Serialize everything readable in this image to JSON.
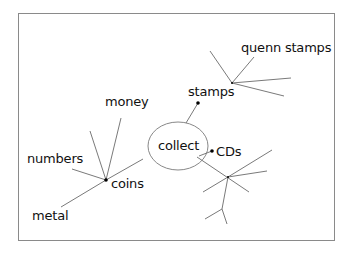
{
  "diagram": {
    "type": "mind-map",
    "central_topic": "collect",
    "branches": [
      {
        "label": "stamps",
        "children": [
          "quenn stamps",
          "",
          "",
          ""
        ]
      },
      {
        "label": "CDs",
        "children": [
          "",
          "",
          "",
          "",
          ""
        ]
      },
      {
        "label": "coins",
        "children": [
          "money",
          "",
          "numbers",
          "metal"
        ]
      }
    ],
    "labels": {
      "center": "collect",
      "stamps": "stamps",
      "quenn_stamps": "quenn stamps",
      "cds": "CDs",
      "coins": "coins",
      "money": "money",
      "numbers": "numbers",
      "metal": "metal"
    },
    "colors": {
      "line": "#7a7a7a",
      "text": "#111111",
      "frame": "#8a8a8a"
    }
  }
}
